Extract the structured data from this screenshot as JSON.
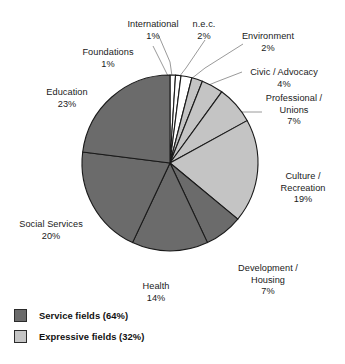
{
  "chart_data": {
    "type": "pie",
    "title": "",
    "subtitle": "",
    "xlabel": "",
    "ylabel": "",
    "units": "percent",
    "start_angle_deg": 0,
    "direction": "clockwise",
    "grid": false,
    "legend_position": "bottom-left",
    "categories": [
      "Foundations",
      "International",
      "n.e.c.",
      "Environment",
      "Civic / Advocacy",
      "Professional / Unions",
      "Culture / Recreation",
      "Development / Housing",
      "Health",
      "Social Services",
      "Education"
    ],
    "values": [
      1,
      1,
      2,
      2,
      4,
      7,
      19,
      7,
      14,
      20,
      23
    ],
    "slices": [
      {
        "label": "Foundations",
        "value": 1,
        "pct_text": "1%",
        "group": "other",
        "color": "#ffffff"
      },
      {
        "label": "International",
        "value": 1,
        "pct_text": "1%",
        "group": "other",
        "color": "#ffffff"
      },
      {
        "label": "n.e.c.",
        "value": 2,
        "pct_text": "2%",
        "group": "other",
        "color": "#ffffff"
      },
      {
        "label": "Environment",
        "value": 2,
        "pct_text": "2%",
        "group": "expressive",
        "color": "#c4c4c4"
      },
      {
        "label": "Civic / Advocacy",
        "value": 4,
        "pct_text": "4%",
        "group": "expressive",
        "color": "#c4c4c4"
      },
      {
        "label": "Professional / Unions",
        "value": 7,
        "pct_text": "7%",
        "group": "expressive",
        "color": "#c4c4c4"
      },
      {
        "label": "Culture / Recreation",
        "value": 19,
        "pct_text": "19%",
        "group": "expressive",
        "color": "#c4c4c4"
      },
      {
        "label": "Development / Housing",
        "value": 7,
        "pct_text": "7%",
        "group": "service",
        "color": "#6b6b6b"
      },
      {
        "label": "Health",
        "value": 14,
        "pct_text": "14%",
        "group": "service",
        "color": "#6b6b6b"
      },
      {
        "label": "Social Services",
        "value": 20,
        "pct_text": "20%",
        "group": "service",
        "color": "#6b6b6b"
      },
      {
        "label": "Education",
        "value": 23,
        "pct_text": "23%",
        "group": "service",
        "color": "#6b6b6b"
      }
    ],
    "legend": [
      {
        "label": "Service fields (64%)",
        "color": "#6b6b6b",
        "value": 64
      },
      {
        "label": "Expressive fields (32%)",
        "color": "#c4c4c4",
        "value": 32
      }
    ]
  },
  "labels": {
    "international": {
      "name": "International",
      "pct": "1%"
    },
    "nec": {
      "name": "n.e.c.",
      "pct": "2%"
    },
    "environment": {
      "name": "Environment",
      "pct": "2%"
    },
    "foundations": {
      "name": "Foundations",
      "pct": "1%"
    },
    "civic": {
      "name": "Civic / Advocacy",
      "pct": "4%"
    },
    "professional": {
      "name": "Professional /\nUnions",
      "pct": "7%"
    },
    "education": {
      "name": "Education",
      "pct": "23%"
    },
    "culture": {
      "name": "Culture /\nRecreation",
      "pct": "19%"
    },
    "social": {
      "name": "Social Services",
      "pct": "20%"
    },
    "development": {
      "name": "Development /\nHousing",
      "pct": "7%"
    },
    "health": {
      "name": "Health",
      "pct": "14%"
    }
  },
  "legend": {
    "service": "Service fields (64%)",
    "expressive": "Expressive fields (32%)"
  },
  "colors": {
    "service": "#6b6b6b",
    "expressive": "#c4c4c4",
    "other": "#ffffff",
    "outline": "#1a1a1a",
    "leader": "#8d8d8d"
  }
}
